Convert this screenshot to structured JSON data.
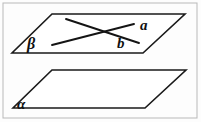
{
  "figure": {
    "background_color": "#fdfdfd",
    "frame_color": "#b9b9b9",
    "stroke_color": "#141414",
    "labels": {
      "line_a": "a",
      "line_b": "b",
      "upper_plane": "β",
      "lower_plane": "α"
    },
    "planes": [
      {
        "name": "upper-plane",
        "label": "β",
        "points": "52,14 185,14 143,53 12,53"
      },
      {
        "name": "lower-plane",
        "label": "α",
        "points": "52,70 186,70 145,108 13,108"
      }
    ],
    "lines": [
      {
        "name": "line-a",
        "label": "a",
        "x1": 66,
        "y1": 19,
        "x2": 139,
        "y2": 43
      },
      {
        "name": "line-b",
        "label": "b",
        "x1": 52,
        "y1": 45,
        "x2": 134,
        "y2": 24
      }
    ],
    "frame": {
      "x": 3,
      "y": 3,
      "width": 194,
      "height": 115
    }
  }
}
